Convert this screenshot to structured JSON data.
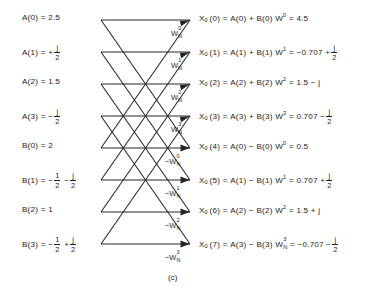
{
  "figure": {
    "caption": "(c)",
    "line_color": "#262626",
    "text_color": "#1d1d1d",
    "background": "#ffffff"
  },
  "inputs": [
    {
      "name": "A(0)",
      "eq": "A(0) = 2.5",
      "label": "A(0)",
      "rel": "=",
      "value": "2.5"
    },
    {
      "name": "A(1)",
      "eq": "A(1) = + j/2",
      "label": "A(1)",
      "rel": "=",
      "value": "+ j/2"
    },
    {
      "name": "A(2)",
      "eq": "A(2) = 1.5",
      "label": "A(2)",
      "rel": "=",
      "value": "1.5"
    },
    {
      "name": "A(3)",
      "eq": "A(3) = - j/2",
      "label": "A(3)",
      "rel": "=",
      "value": "- j/2"
    },
    {
      "name": "B(0)",
      "eq": "B(0) = 2",
      "label": "B(0)",
      "rel": "=",
      "value": "2"
    },
    {
      "name": "B(1)",
      "eq": "B(1) = - 1/2 - j/2",
      "label": "B(1)",
      "rel": "=",
      "value": "- 1/2 - j/2"
    },
    {
      "name": "B(2)",
      "eq": "B(2) = 1",
      "label": "B(2)",
      "rel": "=",
      "value": "1"
    },
    {
      "name": "B(3)",
      "eq": "B(3) = - 1/2 + j/2",
      "label": "B(3)",
      "rel": "=",
      "value": "- 1/2 + j/2"
    }
  ],
  "twiddles": [
    {
      "sign": "",
      "base": "W",
      "sub": "N",
      "sup": "0",
      "text": "W_N^0"
    },
    {
      "sign": "",
      "base": "W",
      "sub": "N",
      "sup": "1",
      "text": "W_N^1"
    },
    {
      "sign": "",
      "base": "W",
      "sub": "N",
      "sup": "2",
      "text": "W_N^2"
    },
    {
      "sign": "",
      "base": "W",
      "sub": "N",
      "sup": "3",
      "text": "W_N^3"
    },
    {
      "sign": "-",
      "base": "W",
      "sub": "N",
      "sup": "0",
      "text": "-W_N^0"
    },
    {
      "sign": "-",
      "base": "W",
      "sub": "N",
      "sup": "1",
      "text": "-W_N^1"
    },
    {
      "sign": "-",
      "base": "W",
      "sub": "N",
      "sup": "2",
      "text": "-W_N^2"
    },
    {
      "sign": "-",
      "base": "W",
      "sub": "N",
      "sup": "3",
      "text": "-W_N^3"
    }
  ],
  "outputs": [
    {
      "index": "0",
      "lhs": "X0(0)",
      "rhs": "A(0) + B(0) W0",
      "result": "4.5",
      "eq": "X0(0) = A(0) + B(0) W^0 = 4.5"
    },
    {
      "index": "1",
      "lhs": "X0(1)",
      "rhs": "A(1) + B(1) W1",
      "result": "-0.707 + j/2",
      "eq": "X0(1) = A(1) + B(1) W^1 = -0.707 + j/2"
    },
    {
      "index": "2",
      "lhs": "X0(2)",
      "rhs": "A(2) + B(2) W2",
      "result": "1.5 - j",
      "eq": "X0(2) = A(2) + B(2) W^2 = 1.5 - j"
    },
    {
      "index": "3",
      "lhs": "X0(3)",
      "rhs": "A(3) + B(3) W3",
      "result": "0.707 - j/2",
      "eq": "X0(3) = A(3) + B(3) W^3 = 0.707 - j/2"
    },
    {
      "index": "4",
      "lhs": "X0(4)",
      "rhs": "A(0) - B(0) W0",
      "result": "0.5",
      "eq": "X0(4) = A(0) - B(0) W^0 = 0.5"
    },
    {
      "index": "5",
      "lhs": "X0(5)",
      "rhs": "A(1) - B(1) W1",
      "result": "0.707 + j/2",
      "eq": "X0(5) = A(1) - B(1) W^1 = 0.707 + j/2"
    },
    {
      "index": "6",
      "lhs": "X0(6)",
      "rhs": "A(2) - B(2) W2",
      "result": "1.5 + j",
      "eq": "X0(6) = A(2) - B(2) W^2 = 1.5 + j"
    },
    {
      "index": "7",
      "lhs": "X0(7)",
      "rhs": "A(3) - B(3) WN3",
      "result": "-0.707 - j/2",
      "eq": "X0(7) = A(3) - B(3) W_N^3 = -0.707 - j/2"
    }
  ],
  "symbols": {
    "X": "X",
    "X_sub": "0",
    "A": "A",
    "B": "B",
    "W": "W",
    "W_sub": "N",
    "j": "j",
    "eq": "=",
    "plus": "+",
    "minus": "−",
    "two": "2",
    "one": "1"
  },
  "tokens": {
    "a0": "A(0)",
    "a1": "A(1)",
    "a2": "A(2)",
    "a3": "A(3)",
    "b0": "B(0)",
    "b1": "B(1)",
    "b2": "B(2)",
    "b3": "B(3)",
    "v_25": "2.5",
    "v_15": "1.5",
    "v_2": "2",
    "v_1": "1",
    "v_45": "4.5",
    "v_05": "0.5",
    "v_0707": "0.707",
    "v_n0707": "−0.707",
    "v_15_minus_j": "1.5 − j",
    "v_15_plus_j": "1.5 + j",
    "sup0": "0",
    "sup1": "1",
    "sup2": "2",
    "sup3": "3",
    "idx0": "0",
    "idx1": "1",
    "idx2": "2",
    "idx3": "3",
    "idx4": "4",
    "idx5": "5",
    "idx6": "6",
    "idx7": "7"
  }
}
